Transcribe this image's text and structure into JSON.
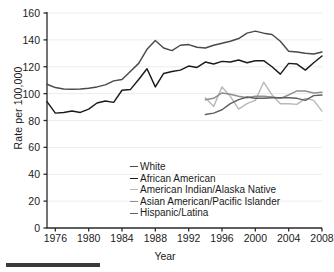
{
  "chart_data": {
    "type": "line",
    "title": "",
    "xlabel": "Year",
    "ylabel": "Rate per 100,000",
    "xlim": [
      1975,
      2008
    ],
    "ylim": [
      0,
      160
    ],
    "grid": "horizontal",
    "legend_position": "inside-bottom-center",
    "yticks": [
      0,
      20,
      40,
      60,
      80,
      100,
      120,
      140,
      160
    ],
    "xticks": [
      1976,
      1980,
      1984,
      1988,
      1992,
      1996,
      2000,
      2004,
      2008
    ],
    "series": [
      {
        "name": "White",
        "color": "#4a4a4a",
        "x": [
          1975,
          1976,
          1977,
          1978,
          1979,
          1980,
          1981,
          1982,
          1983,
          1984,
          1985,
          1986,
          1987,
          1988,
          1989,
          1990,
          1991,
          1992,
          1993,
          1994,
          1995,
          1996,
          1997,
          1998,
          1999,
          2000,
          2001,
          2002,
          2003,
          2004,
          2005,
          2006,
          2007,
          2008
        ],
        "values": [
          107.0,
          104.5,
          103.5,
          103.3,
          103.5,
          104.0,
          105.0,
          106.5,
          109.5,
          110.5,
          116.5,
          122.5,
          133.0,
          139.5,
          134.0,
          132.0,
          136.0,
          136.5,
          134.5,
          134.0,
          136.0,
          137.5,
          139.0,
          141.0,
          145.0,
          146.5,
          145.0,
          144.0,
          139.0,
          131.5,
          131.0,
          130.0,
          129.5,
          131.0
        ]
      },
      {
        "name": "African American",
        "color": "#1b1b1b",
        "x": [
          1975,
          1976,
          1977,
          1978,
          1979,
          1980,
          1981,
          1982,
          1983,
          1984,
          1985,
          1986,
          1987,
          1988,
          1989,
          1990,
          1991,
          1992,
          1993,
          1994,
          1995,
          1996,
          1997,
          1998,
          1999,
          2000,
          2001,
          2002,
          2003,
          2004,
          2005,
          2006,
          2007,
          2008
        ],
        "values": [
          94.0,
          85.5,
          86.0,
          87.0,
          86.0,
          88.5,
          93.0,
          94.5,
          93.5,
          102.5,
          103.0,
          110.5,
          118.5,
          105.0,
          115.0,
          116.5,
          117.5,
          120.5,
          119.5,
          123.5,
          122.0,
          124.0,
          123.5,
          125.0,
          123.0,
          124.5,
          124.5,
          120.0,
          114.5,
          122.5,
          122.0,
          117.5,
          123.0,
          128.0
        ]
      },
      {
        "name": "American Indian/Alaska Native",
        "color": "#b9b9b9",
        "x": [
          1994,
          1995,
          1996,
          1997,
          1998,
          1999,
          2000,
          2001,
          2002,
          2003,
          2004,
          2005,
          2006,
          2007,
          2008
        ],
        "values": [
          97.0,
          90.5,
          105.0,
          98.0,
          88.5,
          92.5,
          95.0,
          108.5,
          99.0,
          92.5,
          92.5,
          92.0,
          96.5,
          95.0,
          87.0
        ]
      },
      {
        "name": "Asian American/Pacific Islander",
        "color": "#8e8e8e",
        "x": [
          1994,
          1995,
          1996,
          1997,
          1998,
          1999,
          2000,
          2001,
          2002,
          2003,
          2004,
          2005,
          2006,
          2007,
          2008
        ],
        "values": [
          95.5,
          96.5,
          100.5,
          99.5,
          98.0,
          97.0,
          98.0,
          98.0,
          97.5,
          96.5,
          99.0,
          102.0,
          102.0,
          100.5,
          101.0
        ]
      },
      {
        "name": "Hispanic/Latina",
        "color": "#5f5f5f",
        "x": [
          1994,
          1995,
          1996,
          1997,
          1998,
          1999,
          2000,
          2001,
          2002,
          2003,
          2004,
          2005,
          2006,
          2007,
          2008
        ],
        "values": [
          84.5,
          85.5,
          88.0,
          92.5,
          95.5,
          97.5,
          96.5,
          96.5,
          97.0,
          97.0,
          97.0,
          96.5,
          95.0,
          98.5,
          99.0
        ]
      }
    ]
  },
  "legend": {
    "items": [
      {
        "label": "White"
      },
      {
        "label": "African American"
      },
      {
        "label": "American Indian/Alaska Native"
      },
      {
        "label": "Asian American/Pacific Islander"
      },
      {
        "label": "Hispanic/Latina"
      }
    ]
  }
}
